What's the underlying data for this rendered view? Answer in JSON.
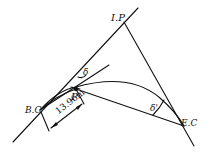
{
  "diagram": {
    "type": "circular-curve-deflection-angle",
    "labels": {
      "ip": "I.P",
      "bc": "B.C",
      "ec": "E.C",
      "p": "P",
      "delta_top": "δ",
      "delta_bottom": "δ'",
      "distance": "13.96m"
    },
    "points": {
      "IP": [
        124,
        22
      ],
      "BC": [
        40,
        110
      ],
      "EC": [
        184,
        126
      ],
      "P": [
        76,
        89
      ]
    },
    "colors": {
      "line": "#111111",
      "background": "#ffffff"
    }
  }
}
